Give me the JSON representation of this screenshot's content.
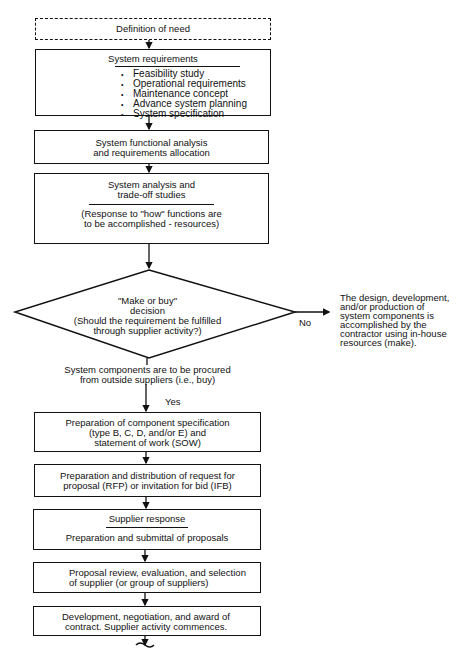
{
  "flowchart": {
    "definition_of_need": "Definition of need",
    "system_requirements": {
      "title": "System requirements",
      "items": [
        "Feasibility study",
        "Operational requirements",
        "Maintenance concept",
        "Advance system planning",
        "System specification"
      ]
    },
    "functional_analysis": {
      "line1": "System functional analysis",
      "line2": "and requirements allocation"
    },
    "system_analysis": {
      "line1": "System analysis and",
      "line2": "trade-off studies",
      "sub1": "(Response to \"how\" functions are",
      "sub2": "to be accomplished - resources)"
    },
    "decision": {
      "line1": "\"Make or buy\"",
      "line2": "decision",
      "line3": "(Should the requirement be fulfilled",
      "line4": "through supplier activity?)"
    },
    "no_label": "No",
    "make_text": {
      "line1": "The design, development,",
      "line2": "and/or production of",
      "line3": "system components is",
      "line4": "accomplished by the",
      "line5": "contractor using in-house",
      "line6": "resources (make)."
    },
    "buy_text": {
      "line1": "System components are to be procured",
      "line2": "from outside suppliers (i.e., buy)"
    },
    "yes_label": "Yes",
    "component_spec": {
      "line1": "Preparation of component specification",
      "line2": "(type B, C, D, and/or E) and",
      "line3": "statement of work (SOW)"
    },
    "rfp": {
      "line1": "Preparation and distribution of request for",
      "line2": "proposal (RFP) or invitation for bid (IFB)"
    },
    "supplier_response": {
      "title": "Supplier response",
      "sub": "Preparation and submittal of proposals"
    },
    "proposal_review": {
      "line1": "Proposal review, evaluation, and selection",
      "line2": "of supplier (or group of suppliers)"
    },
    "contract": {
      "line1": "Development, negotiation, and award of",
      "line2": "contract.  Supplier activity commences."
    }
  }
}
